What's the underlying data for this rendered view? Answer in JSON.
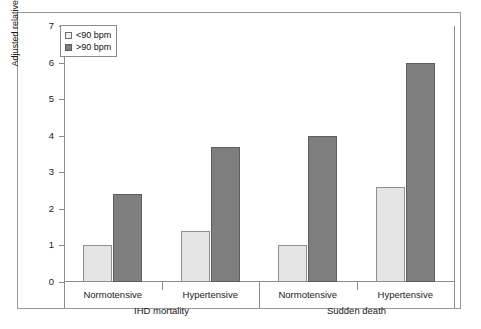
{
  "chart_data": {
    "type": "bar",
    "title": "",
    "xlabel": "",
    "ylabel": "Adjusted relative risk",
    "ylim": [
      0,
      7
    ],
    "yticks": [
      0,
      1,
      2,
      3,
      4,
      5,
      6,
      7
    ],
    "grid": false,
    "legend_position": "top-left",
    "series": [
      {
        "name": "<90 bpm",
        "color": "#e4e4e4",
        "values": [
          1.0,
          1.4,
          1.0,
          2.6
        ]
      },
      {
        "name": ">90 bpm",
        "color": "#7e7e7e",
        "values": [
          2.4,
          3.7,
          4.0,
          6.0
        ]
      }
    ],
    "categories": [
      "Normotensive",
      "Hypertensive",
      "Normotensive",
      "Hypertensive"
    ],
    "groups": [
      {
        "label": "IHD mortality",
        "categories": [
          "Normotensive",
          "Hypertensive"
        ]
      },
      {
        "label": "Sudden death",
        "categories": [
          "Normotensive",
          "Hypertensive"
        ]
      }
    ]
  },
  "legend": {
    "items": [
      {
        "label": "<90 bpm",
        "swatch": "light"
      },
      {
        "label": ">90 bpm",
        "swatch": "dark"
      }
    ]
  },
  "axis": {
    "y_label": "Adjusted relative risk",
    "y_ticks": [
      "7",
      "6",
      "5",
      "4",
      "3",
      "2",
      "1",
      "0"
    ]
  },
  "groups": [
    {
      "label": "IHD mortality",
      "subgroups": [
        "Normotensive",
        "Hypertensive"
      ]
    },
    {
      "label": "Sudden death",
      "subgroups": [
        "Normotensive",
        "Hypertensive"
      ]
    }
  ],
  "colors": {
    "light_bar": "#e4e4e4",
    "dark_bar": "#7e7e7e",
    "axis": "#8c8c8c",
    "frame": "#9a9a9a"
  }
}
